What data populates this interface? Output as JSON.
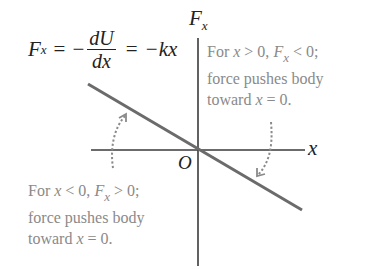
{
  "diagram": {
    "type": "force-vs-displacement graph",
    "equation": {
      "lhs": "F",
      "lhs_sub": "x",
      "eq1": "=",
      "minus1": "−",
      "frac_num": "dU",
      "frac_den": "dx",
      "eq2": "=",
      "rhs": "−kx"
    },
    "axes": {
      "y_label": "F",
      "y_label_sub": "x",
      "x_label": "x",
      "origin_label": "O"
    },
    "annotations": {
      "right": {
        "line1_a": "For ",
        "line1_x": "x",
        "line1_b": " > 0, ",
        "line1_F": "F",
        "line1_sub": "x",
        "line1_c": " < 0;",
        "line2": "force pushes body",
        "line3_a": "toward ",
        "line3_x": "x",
        "line3_b": " = 0."
      },
      "left": {
        "line1_a": "For ",
        "line1_x": "x",
        "line1_b": " < 0, ",
        "line1_F": "F",
        "line1_sub": "x",
        "line1_c": " > 0;",
        "line2": "force pushes body",
        "line3_a": "toward ",
        "line3_x": "x",
        "line3_b": " = 0."
      }
    },
    "colors": {
      "axis": "#3a3a3a",
      "line": "#6b6b6b",
      "dashed_arrow": "#8a8a8a",
      "note_text": "#8a8a8a",
      "equation_text": "#222222"
    }
  }
}
